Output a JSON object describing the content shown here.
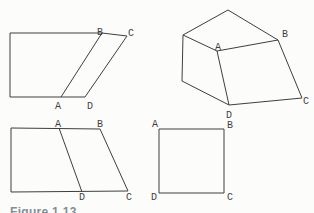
{
  "colors": {
    "background": "#fcfcfb",
    "ink": "#3e3e3e",
    "caption": "#848d95"
  },
  "caption": {
    "text": "Figure 1.13"
  },
  "figures": {
    "top_left": {
      "labels": {
        "A": "A",
        "B": "B",
        "C": "C",
        "D": "D"
      }
    },
    "top_right_solid": {
      "labels": {
        "A": "A",
        "B": "B",
        "C": "C",
        "D": "D"
      }
    },
    "bottom_left": {
      "labels": {
        "A": "A",
        "B": "B",
        "C": "C",
        "D": "D"
      }
    },
    "bottom_right_square": {
      "labels": {
        "A": "A",
        "B": "B",
        "C": "C",
        "D": "D"
      }
    }
  }
}
